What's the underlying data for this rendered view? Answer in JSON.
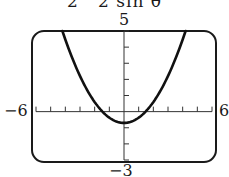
{
  "equation_fragment": "2   2 sin θ",
  "chart_data": {
    "type": "line",
    "xlabel": "",
    "ylabel": "",
    "xlim": [
      -6,
      6
    ],
    "ylim": [
      -3,
      5
    ],
    "x_tick_step": 1,
    "y_tick_step": 1,
    "grid": false,
    "window_labels": {
      "ymax": "5",
      "ymin": "−3",
      "xmin": "−6",
      "xmax": "6"
    },
    "series": [
      {
        "name": "curve",
        "x": [
          -4.2,
          -3,
          -2,
          -1.4,
          -1,
          0,
          1,
          1.4,
          2,
          3,
          4.2
        ],
        "y": [
          5,
          2.2,
          0.6,
          0,
          -0.35,
          -0.7,
          -0.35,
          0,
          0.6,
          2.2,
          5
        ]
      }
    ]
  }
}
